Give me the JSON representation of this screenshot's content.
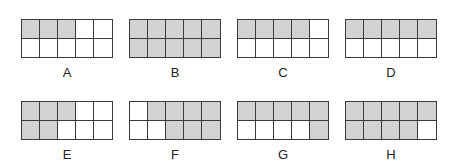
{
  "figure": {
    "rows": 2,
    "cols": 5,
    "shade_color": "#d2d2d2",
    "line_color": "#3a3a3a",
    "grids": [
      {
        "label": "A",
        "shaded": [
          [
            1,
            1,
            1,
            0,
            0
          ],
          [
            0,
            0,
            0,
            0,
            0
          ]
        ],
        "shaded_count": 3
      },
      {
        "label": "B",
        "shaded": [
          [
            1,
            1,
            1,
            1,
            1
          ],
          [
            1,
            1,
            1,
            1,
            1
          ]
        ],
        "shaded_count": 10
      },
      {
        "label": "C",
        "shaded": [
          [
            1,
            1,
            1,
            1,
            0
          ],
          [
            0,
            0,
            0,
            0,
            0
          ]
        ],
        "shaded_count": 4
      },
      {
        "label": "D",
        "shaded": [
          [
            1,
            1,
            1,
            1,
            1
          ],
          [
            0,
            0,
            0,
            0,
            0
          ]
        ],
        "shaded_count": 5
      },
      {
        "label": "E",
        "shaded": [
          [
            1,
            1,
            1,
            0,
            0
          ],
          [
            1,
            1,
            0,
            0,
            0
          ]
        ],
        "shaded_count": 5
      },
      {
        "label": "F",
        "shaded": [
          [
            0,
            1,
            1,
            1,
            1
          ],
          [
            0,
            0,
            1,
            1,
            1
          ]
        ],
        "shaded_count": 7
      },
      {
        "label": "G",
        "shaded": [
          [
            1,
            1,
            1,
            1,
            1
          ],
          [
            0,
            0,
            0,
            0,
            1
          ]
        ],
        "shaded_count": 6
      },
      {
        "label": "H",
        "shaded": [
          [
            1,
            1,
            1,
            1,
            1
          ],
          [
            1,
            1,
            1,
            1,
            0
          ]
        ],
        "shaded_count": 9
      }
    ]
  }
}
